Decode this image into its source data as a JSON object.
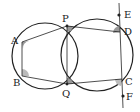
{
  "diagram": {
    "colors": {
      "stroke": "#222222",
      "angle_fill": "#999999",
      "background": "#ffffff"
    },
    "points": {
      "A": {
        "label": "A",
        "x": 22,
        "y": 42
      },
      "B": {
        "label": "B",
        "x": 22,
        "y": 76
      },
      "P": {
        "label": "P",
        "x": 67,
        "y": 26
      },
      "Q": {
        "label": "Q",
        "x": 67,
        "y": 84
      },
      "D": {
        "label": "D",
        "x": 120,
        "y": 32
      },
      "C": {
        "label": "C",
        "x": 122,
        "y": 79
      },
      "E": {
        "label": "E",
        "x": 119,
        "y": 15
      },
      "F": {
        "label": "F",
        "x": 123,
        "y": 96
      }
    },
    "circles": [
      {
        "name": "left-circle",
        "cx": 45,
        "cy": 56,
        "r": 33
      },
      {
        "name": "right-circle",
        "cx": 97,
        "cy": 55,
        "r": 36
      }
    ],
    "segments": [
      "AB",
      "AP",
      "BQ",
      "PQ",
      "PD",
      "QC",
      "EF"
    ],
    "angle_marks": [
      "A",
      "B",
      "P",
      "Q",
      "D",
      "C"
    ]
  }
}
